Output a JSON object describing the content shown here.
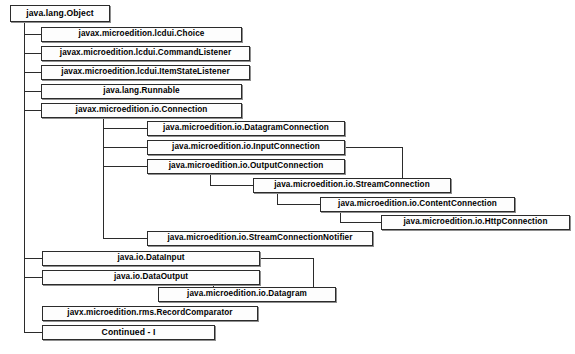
{
  "diagram": {
    "type": "class-hierarchy-tree",
    "title_node": "java.lang.Object",
    "background_color": "#ffffff",
    "box_border_color": "#2b2b2b",
    "box_fill_color": "#fdfdfd",
    "nodes": [
      {
        "id": "object",
        "label": "java.lang.Object",
        "x": 10,
        "y": 5,
        "w": 100,
        "h": 17
      },
      {
        "id": "choice",
        "label": "javax.microedition.lcdui.Choice",
        "x": 41,
        "y": 27,
        "w": 201,
        "h": 15
      },
      {
        "id": "command_listener",
        "label": "javax.microedition.lcdui.CommandListener",
        "x": 41,
        "y": 46,
        "w": 209,
        "h": 15
      },
      {
        "id": "item_state_listener",
        "label": "javax.microedition.lcdui.ItemStateListener",
        "x": 41,
        "y": 65,
        "w": 209,
        "h": 15
      },
      {
        "id": "runnable",
        "label": "java.lang.Runnable",
        "x": 41,
        "y": 84,
        "w": 201,
        "h": 15
      },
      {
        "id": "connection",
        "label": "javax.microedition.io.Connection",
        "x": 41,
        "y": 103,
        "w": 201,
        "h": 15
      },
      {
        "id": "datagram_connection",
        "label": "java.microedition.io.DatagramConnection",
        "x": 147,
        "y": 121,
        "w": 198,
        "h": 15
      },
      {
        "id": "input_connection",
        "label": "java.microedition.io.InputConnection",
        "x": 147,
        "y": 140,
        "w": 198,
        "h": 15
      },
      {
        "id": "output_connection",
        "label": "java.microedition.io.OutputConnection",
        "x": 147,
        "y": 159,
        "w": 198,
        "h": 15
      },
      {
        "id": "stream_connection",
        "label": "java.microedition.io.StreamConnection",
        "x": 253,
        "y": 178,
        "w": 198,
        "h": 15
      },
      {
        "id": "content_connection",
        "label": "java.microedition.io.ContentConnection",
        "x": 320,
        "y": 197,
        "w": 195,
        "h": 15
      },
      {
        "id": "http_connection",
        "label": "java.microedition.io.HttpConnection",
        "x": 381,
        "y": 215,
        "w": 189,
        "h": 15
      },
      {
        "id": "stream_conn_notifier",
        "label": "java.microedition.io.StreamConnectionNotifier",
        "x": 147,
        "y": 231,
        "w": 226,
        "h": 15
      },
      {
        "id": "data_input",
        "label": "java.io.DataInput",
        "x": 42,
        "y": 251,
        "w": 218,
        "h": 15
      },
      {
        "id": "data_output",
        "label": "java.io.DataOutput",
        "x": 42,
        "y": 270,
        "w": 218,
        "h": 15
      },
      {
        "id": "datagram",
        "label": "java.microedition.io.Datagram",
        "x": 158,
        "y": 287,
        "w": 178,
        "h": 15
      },
      {
        "id": "record_comparator",
        "label": "javx.microedition.rms.RecordComparator",
        "x": 42,
        "y": 306,
        "w": 216,
        "h": 15
      },
      {
        "id": "continued",
        "label": "Continued - I",
        "x": 42,
        "y": 325,
        "w": 173,
        "h": 15
      }
    ],
    "edges": [
      {
        "from": "object",
        "to": "choice"
      },
      {
        "from": "object",
        "to": "command_listener"
      },
      {
        "from": "object",
        "to": "item_state_listener"
      },
      {
        "from": "object",
        "to": "runnable"
      },
      {
        "from": "object",
        "to": "connection"
      },
      {
        "from": "object",
        "to": "data_input"
      },
      {
        "from": "object",
        "to": "data_output"
      },
      {
        "from": "object",
        "to": "continued"
      },
      {
        "from": "connection",
        "to": "datagram_connection"
      },
      {
        "from": "connection",
        "to": "input_connection"
      },
      {
        "from": "connection",
        "to": "output_connection"
      },
      {
        "from": "connection",
        "to": "stream_conn_notifier"
      },
      {
        "from": "input_connection",
        "to": "stream_connection"
      },
      {
        "from": "output_connection",
        "to": "stream_connection"
      },
      {
        "from": "stream_connection",
        "to": "content_connection"
      },
      {
        "from": "content_connection",
        "to": "http_connection"
      },
      {
        "from": "data_input",
        "to": "datagram"
      },
      {
        "from": "data_output",
        "to": "datagram"
      }
    ]
  }
}
